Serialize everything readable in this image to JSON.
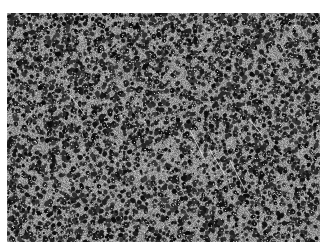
{
  "image": {
    "description": "Grayscale scanning electron micrograph of a porous material with densely packed dark pores separated by bright walls",
    "colors": {
      "pore": "#1a1a1a",
      "wall": "#9a9a9a",
      "highlight": "#e8e8e8",
      "background": "#ffffff"
    }
  }
}
